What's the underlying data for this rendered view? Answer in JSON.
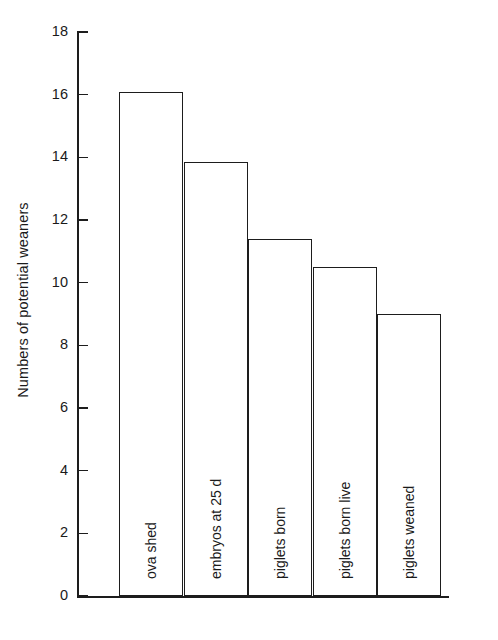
{
  "chart_data": {
    "type": "bar",
    "title": "",
    "xlabel": "",
    "ylabel": "Numbers of potential weaners",
    "categories": [
      "ova shed",
      "embryos at 25 d",
      "piglets born",
      "piglets born live",
      "piglets weaned"
    ],
    "values": [
      16.1,
      13.85,
      11.4,
      10.5,
      9.0
    ],
    "ylim": [
      0,
      18
    ],
    "yticks": [
      0,
      2,
      4,
      6,
      8,
      10,
      12,
      14,
      16,
      18
    ],
    "ytick_labels": [
      "0",
      "2",
      "4",
      "6",
      "8",
      "10",
      "12",
      "14",
      "16",
      "18"
    ],
    "grid": false,
    "legend": null,
    "bar_fill_color": "#ffffff",
    "bar_edge_color": "#1d1d1d",
    "axis_color": "#1d1d1d",
    "background_color": "#ffffff",
    "bar_label_rotation": 90,
    "bar_labels_inside": true
  }
}
